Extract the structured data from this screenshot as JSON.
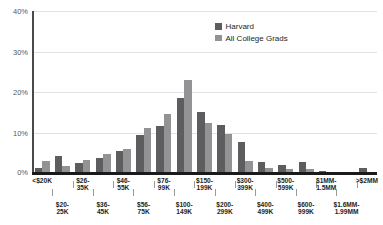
{
  "chart_data": {
    "type": "bar",
    "title": "",
    "subtitle": "",
    "xlabel": "",
    "ylabel": "",
    "ylim": [
      0,
      40
    ],
    "yticks": [
      "0%",
      "10%",
      "20%",
      "30%",
      "40%"
    ],
    "ytick_values": [
      0,
      10,
      20,
      30,
      40
    ],
    "grid": true,
    "legend_position": "top-right",
    "categories": [
      "<$20K",
      "$20-\n25K",
      "$26-\n35K",
      "$36-\n45K",
      "$46-\n55K",
      "$56-\n75K",
      "$76-\n99K",
      "$100-\n149K",
      "$150-\n199K",
      "$200-\n299K",
      "$300-\n399K",
      "$400-\n499K",
      "$500-\n599K",
      "$600-\n999K",
      "$1MM-\n1.5MM",
      "$1.6MM-\n1.99MM",
      ">$2MM"
    ],
    "series": [
      {
        "name": "Harvard",
        "color": "#5d5d5f",
        "values": [
          1.3,
          4.3,
          2.5,
          3.7,
          5.5,
          9.5,
          11.7,
          18.5,
          15.1,
          11.8,
          7.6,
          2.6,
          2.0,
          2.7,
          0.6,
          0.25,
          1.2
        ]
      },
      {
        "name": "All College Grads",
        "color": "#939395",
        "values": [
          2.9,
          1.8,
          3.2,
          4.8,
          5.9,
          11.1,
          14.5,
          23.0,
          12.3,
          9.6,
          2.9,
          1.2,
          0.9,
          0.9,
          0.15,
          0.1,
          0.1
        ]
      }
    ]
  },
  "legend": {
    "items": [
      {
        "label": "Harvard",
        "color": "#5d5d5f"
      },
      {
        "label": "All College Grads",
        "color": "#939395"
      }
    ]
  },
  "axis": {
    "y_ticks": [
      {
        "label": "40%",
        "value": 40
      },
      {
        "label": "30%",
        "value": 30
      },
      {
        "label": "20%",
        "value": 20
      },
      {
        "label": "10%",
        "value": 10
      },
      {
        "label": "0%",
        "value": 0
      }
    ]
  },
  "x_labels": {
    "top_row": [
      "<$20K",
      "$26-\n35K",
      "$46-\n55K",
      "$76-\n99K",
      "$150-\n199K",
      "$300-\n399K",
      "$500-\n599K",
      "$1MM-\n1.5MM",
      ">$2MM"
    ],
    "bottom_row": [
      "$20-\n25K",
      "$36-\n45K",
      "$56-\n75K",
      "$100-\n149K",
      "$200-\n299K",
      "$400-\n499K",
      "$600-\n999K",
      "$1.6MM-\n1.99MM"
    ]
  }
}
